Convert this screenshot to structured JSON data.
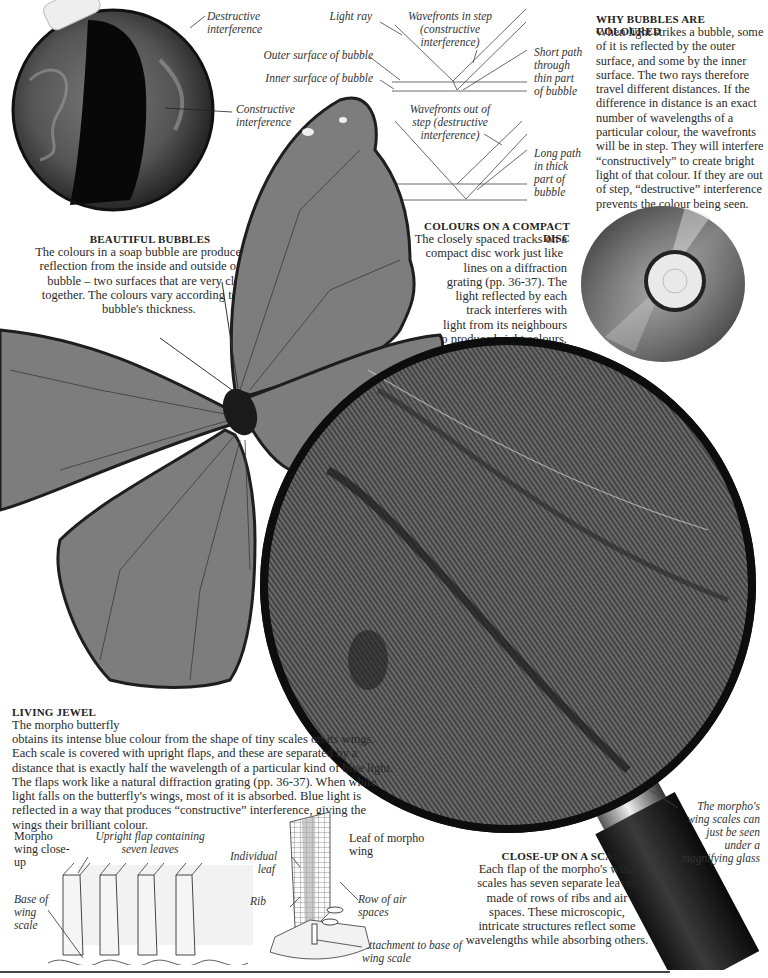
{
  "bubble": {
    "label_destructive": "Destructive interference",
    "label_constructive": "Constructive interference",
    "heading": "BEAUTIFUL BUBBLES",
    "text": "The colours in a soap bubble are produced by reflection from the inside and outside of the bubble – two surfaces that are very close together. The colours vary according to the bubble's thickness."
  },
  "diagram": {
    "light_ray": "Light ray",
    "outer_surface": "Outer surface of bubble",
    "inner_surface": "Inner surface of bubble",
    "wavefronts_in_step": "Wavefronts in step (constructive interference)",
    "short_path": "Short path through thin part of bubble",
    "wavefronts_out_of_step": "Wavefronts out of step (destructive interference)",
    "long_path": "Long path in thick part of bubble"
  },
  "why_coloured": {
    "heading": "WHY BUBBLES ARE COLOURED",
    "text": "When light strikes a bubble, some of it is reflected by the outer surface, and some by the inner surface. The two rays therefore travel different distances. If the difference in distance is an exact number of wavelengths of a particular colour, the wavefronts will be in step. They will interfere “constructively” to create bright light of that colour. If they are out of step, “destructive” interference prevents the colour being seen."
  },
  "compact_disc": {
    "heading": "COLOURS ON A COMPACT DISC",
    "lines": [
      "The closely spaced tracks on a",
      "compact disc work just like",
      "lines on a diffraction",
      "grating (pp. 36-37). The",
      "light reflected by each",
      "track interferes with",
      "light from its neighbours",
      "to produce bright colours."
    ]
  },
  "living_jewel": {
    "heading": "LIVING JEWEL",
    "first_line": "The morpho butterfly",
    "text": "obtains its intense blue colour from the shape of tiny scales on its wings. Each scale is covered with upright flaps, and these are separated by a distance that is exactly half the wavelength of a particular kind of blue light. The flaps work like a natural diffraction grating (pp. 36-37). When white light falls on the butterfly's wings, most of it is absorbed. Blue light is reflected in a way that produces “constructive” interference, giving the wings their brilliant colour."
  },
  "wing_closeup": {
    "title": "Morpho wing close-up",
    "upright_flap": "Upright flap containing seven leaves",
    "base_of_scale": "Base of wing scale"
  },
  "leaf": {
    "title": "Leaf of morpho wing",
    "individual_leaf": "Individual leaf",
    "rib": "Rib",
    "row_air_spaces": "Row of air spaces",
    "attachment": "Attachment to base of wing scale"
  },
  "magnifier": {
    "caption": "The morpho's wing scales can just be seen under a magnifying glass"
  },
  "closeup_scale": {
    "heading": "CLOSE-UP ON A SCALE",
    "lines": [
      "Each flap of the morpho's wing",
      "scales has seven separate leaves",
      "made of rows of ribs and air",
      "spaces. These microscopic,",
      "intricate structures reflect some",
      "wavelengths while absorbing others."
    ]
  }
}
